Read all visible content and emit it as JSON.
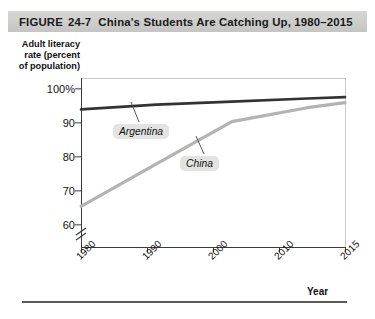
{
  "figure": {
    "label": "FIGURE",
    "number": "24-7",
    "title": "China's Students Are Catching Up, 1980–2015",
    "bottom_caption": ""
  },
  "chart_data": {
    "type": "line",
    "title": "China's Students Are Catching Up, 1980–2015",
    "xlabel": "Year",
    "ylabel": "Adult literacy rate (percent of population)",
    "ylabel_lines": [
      "Adult literacy",
      "rate (percent",
      "of population)"
    ],
    "x": [
      1980,
      1990,
      2000,
      2010,
      2015
    ],
    "xlim": [
      1980,
      2015
    ],
    "ylim": [
      57,
      101
    ],
    "y_ticks": [
      60,
      70,
      80,
      90,
      100
    ],
    "y_tick_labels": [
      "60",
      "70",
      "80",
      "90",
      "100%"
    ],
    "x_ticks": [
      1980,
      1990,
      2000,
      2010,
      2015
    ],
    "x_tick_labels": [
      "1980",
      "1990",
      "2000",
      "2010",
      "2015"
    ],
    "axis_break": true,
    "grid": false,
    "legend": "inline-labels",
    "series": [
      {
        "name": "Argentina",
        "color": "#333333",
        "values": [
          94.0,
          95.4,
          96.3,
          97.2,
          97.6
        ]
      },
      {
        "name": "China",
        "color": "#b3b3b1",
        "values": [
          65.5,
          78.0,
          90.4,
          94.5,
          96.0
        ]
      }
    ]
  }
}
